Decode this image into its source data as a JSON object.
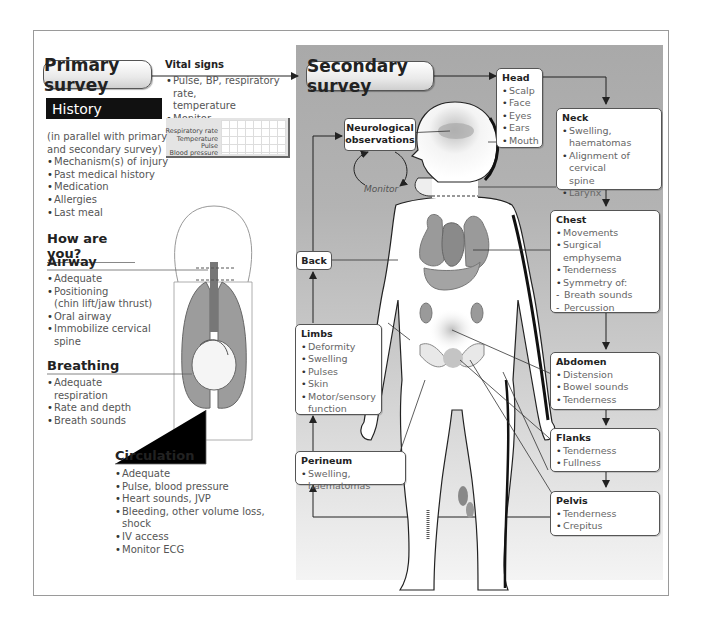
{
  "primary": {
    "title": "Primary survey",
    "vital_signs": {
      "title": "Vital signs",
      "items": [
        "Pulse, BP, respiratory rate,",
        "temperature",
        "Monitor"
      ],
      "chart_labels": [
        "Respiratory rate",
        "Temperature",
        "Pulse",
        "Blood pressure"
      ]
    },
    "history": {
      "title": "History",
      "intro": [
        "(in parallel with primary",
        "and secondary survey)"
      ],
      "items": [
        "Mechanism(s) of injury",
        "Past medical history",
        "Medication",
        "Allergies",
        "Last meal"
      ]
    },
    "how_are_you": "How are you?",
    "airway": {
      "title": "Airway",
      "items": [
        "Adequate",
        "Positioning",
        "(chin lift/jaw thrust)",
        "Oral airway",
        "Immobilize cervical",
        "spine"
      ]
    },
    "breathing": {
      "title": "Breathing",
      "items": [
        "Adequate",
        "respiration",
        "Rate and depth",
        "Breath sounds"
      ]
    },
    "circulation": {
      "title": "Circulation",
      "items": [
        "Adequate",
        "Pulse, blood pressure",
        "Heart sounds, JVP",
        "Bleeding, other volume loss, shock",
        "IV access",
        "Monitor ECG"
      ]
    }
  },
  "secondary": {
    "title": "Secondary survey",
    "neuro": {
      "line1": "Neurological",
      "line2": "observations",
      "monitor": "Monitor"
    },
    "back": "Back",
    "head": {
      "title": "Head",
      "items": [
        "Scalp",
        "Face",
        "Eyes",
        "Ears",
        "Mouth"
      ]
    },
    "neck": {
      "title": "Neck",
      "items": [
        "Swelling,",
        "haematomas",
        "Alignment of cervical",
        "spine",
        "Larynx"
      ]
    },
    "chest": {
      "title": "Chest",
      "items": [
        "Movements",
        "Surgical emphysema",
        "Tenderness",
        "Symmetry of:",
        "Breath sounds",
        "Percussion"
      ]
    },
    "abdomen": {
      "title": "Abdomen",
      "items": [
        "Distension",
        "Bowel sounds",
        "Tenderness"
      ]
    },
    "flanks": {
      "title": "Flanks",
      "items": [
        "Tenderness",
        "Fullness"
      ]
    },
    "pelvis": {
      "title": "Pelvis",
      "items": [
        "Tenderness",
        "Crepitus"
      ]
    },
    "limbs": {
      "title": "Limbs",
      "items": [
        "Deformity",
        "Swelling",
        "Pulses",
        "Skin",
        "Motor/sensory",
        "function"
      ]
    },
    "perineum": {
      "title": "Perineum",
      "items": [
        "Swelling, haematomas"
      ]
    }
  },
  "colors": {
    "panel_top": "#a9a9a9",
    "panel_bottom": "#f4f4f4",
    "history_bg": "#111111",
    "organ": "#9a9a9a",
    "line": "#333333"
  }
}
